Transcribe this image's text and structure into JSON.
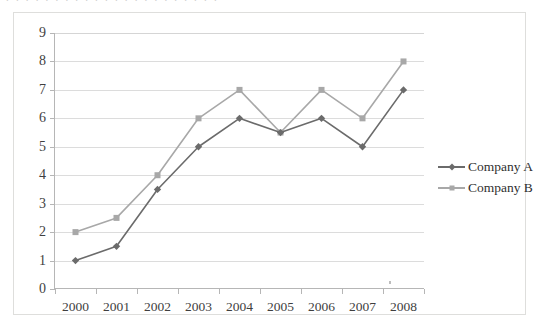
{
  "figure": {
    "background_color": "#ffffff",
    "border_color": "#dededc",
    "gridline_color": "#dcdcdc",
    "axis_color": "#b6b6b6",
    "clipped_top_text": ". . . . . . . . . . . . . . . . . . . . . ."
  },
  "legend": {
    "position": "right",
    "entries": [
      {
        "label": "Company A",
        "color": "#6b6b6b",
        "marker": "diamond"
      },
      {
        "label": "Company B",
        "color": "#a8a8a8",
        "marker": "square"
      }
    ]
  },
  "chart_data": {
    "type": "line",
    "title": "",
    "xlabel": "",
    "ylabel": "",
    "categories": [
      "2000",
      "2001",
      "2002",
      "2003",
      "2004",
      "2005",
      "2006",
      "2007",
      "2008"
    ],
    "yticks": [
      0,
      1,
      2,
      3,
      4,
      5,
      6,
      7,
      8,
      9
    ],
    "ylim": [
      0,
      9
    ],
    "grid": true,
    "legend_position": "right",
    "series": [
      {
        "name": "Company A",
        "color": "#6b6b6b",
        "marker": "diamond",
        "values": [
          1,
          1.5,
          3.5,
          5,
          6,
          5.5,
          6,
          5,
          7
        ]
      },
      {
        "name": "Company B",
        "color": "#a8a8a8",
        "marker": "square",
        "values": [
          2,
          2.5,
          4,
          6,
          7,
          5.5,
          7,
          6,
          8
        ]
      }
    ]
  }
}
